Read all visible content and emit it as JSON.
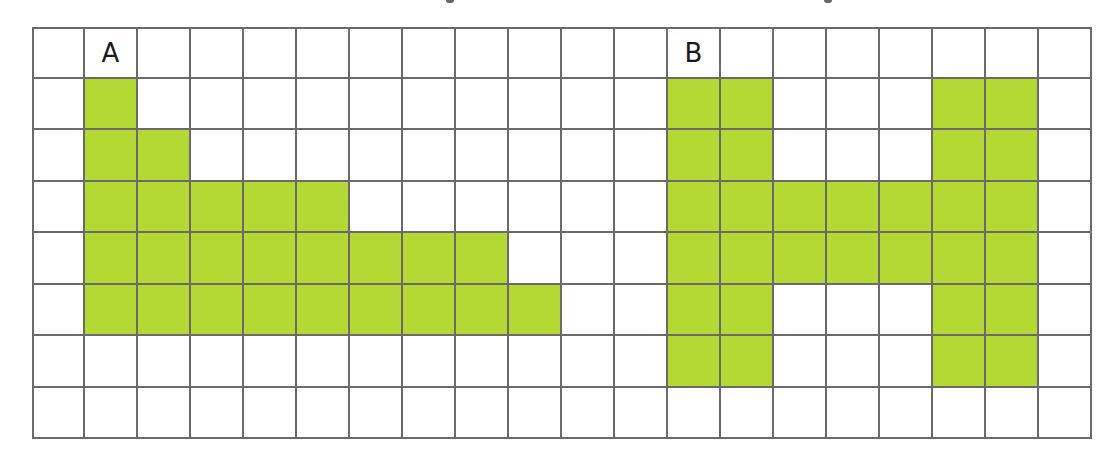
{
  "figure": {
    "grid": {
      "columns": 20,
      "rows": 8,
      "line_color": "#6a6a6a",
      "fill_color": "#b5d934",
      "background_color": "#ffffff"
    },
    "shapes": [
      {
        "label": "A",
        "label_cell": [
          0,
          1
        ],
        "cells": [
          [
            1,
            1
          ],
          [
            2,
            1
          ],
          [
            2,
            2
          ],
          [
            3,
            1
          ],
          [
            3,
            2
          ],
          [
            3,
            3
          ],
          [
            3,
            4
          ],
          [
            3,
            5
          ],
          [
            4,
            1
          ],
          [
            4,
            2
          ],
          [
            4,
            3
          ],
          [
            4,
            4
          ],
          [
            4,
            5
          ],
          [
            4,
            6
          ],
          [
            4,
            7
          ],
          [
            4,
            8
          ],
          [
            5,
            1
          ],
          [
            5,
            2
          ],
          [
            5,
            3
          ],
          [
            5,
            4
          ],
          [
            5,
            5
          ],
          [
            5,
            6
          ],
          [
            5,
            7
          ],
          [
            5,
            8
          ],
          [
            5,
            9
          ]
        ],
        "area_squares": 25
      },
      {
        "label": "B",
        "label_cell": [
          0,
          12
        ],
        "cells": [
          [
            1,
            12
          ],
          [
            1,
            13
          ],
          [
            1,
            17
          ],
          [
            1,
            18
          ],
          [
            2,
            12
          ],
          [
            2,
            13
          ],
          [
            2,
            17
          ],
          [
            2,
            18
          ],
          [
            3,
            12
          ],
          [
            3,
            13
          ],
          [
            3,
            14
          ],
          [
            3,
            15
          ],
          [
            3,
            16
          ],
          [
            3,
            17
          ],
          [
            3,
            18
          ],
          [
            4,
            12
          ],
          [
            4,
            13
          ],
          [
            4,
            14
          ],
          [
            4,
            15
          ],
          [
            4,
            16
          ],
          [
            4,
            17
          ],
          [
            4,
            18
          ],
          [
            5,
            12
          ],
          [
            5,
            13
          ],
          [
            5,
            17
          ],
          [
            5,
            18
          ],
          [
            6,
            12
          ],
          [
            6,
            13
          ],
          [
            6,
            17
          ],
          [
            6,
            18
          ]
        ],
        "area_squares": 30
      }
    ]
  }
}
